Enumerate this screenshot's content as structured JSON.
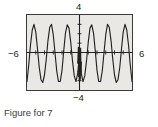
{
  "figure": {
    "caption": "Figure for 7",
    "axis_labels": {
      "y_max": "4",
      "y_min": "−4",
      "x_min": "−6",
      "x_max": "6"
    },
    "colors": {
      "plot_background": "#e9e8e5",
      "plot_border": "#3a3a38",
      "curve": "#231f20",
      "axis": "#231f20",
      "page_background": "#ffffff",
      "caption_text": "#3b3b3b"
    }
  },
  "chart_data": {
    "type": "line",
    "title": "",
    "subtitle": "",
    "xlabel": "",
    "ylabel": "",
    "xlim": [
      -6,
      6
    ],
    "ylim": [
      -4,
      4
    ],
    "xticks": [
      -6,
      -5,
      -4,
      -3,
      -2,
      -1,
      0,
      1,
      2,
      3,
      4,
      5,
      6
    ],
    "yticks": [
      -4,
      -3,
      -2,
      -1,
      0,
      1,
      2,
      3,
      4
    ],
    "grid": false,
    "tick_marks": true,
    "legend": null,
    "legend_position": "none",
    "annotations": [
      {
        "text": "4",
        "position": "top-center",
        "x": 0,
        "y": 4
      },
      {
        "text": "−4",
        "position": "bottom-center",
        "x": 0,
        "y": -4
      },
      {
        "text": "−6",
        "position": "left-middle",
        "x": -6,
        "y": 0
      },
      {
        "text": "6",
        "position": "right-middle",
        "x": 6,
        "y": 0
      }
    ],
    "series": [
      {
        "name": "curve",
        "description": "Oscillating wave, ~6 full cycles across [-6, 6], narrow cusp-like peaks reaching about y = 3 and broader troughs reaching about y = -3.2, with a compressed high-frequency spike near x = 0.",
        "color": "#231f20",
        "x": [
          -6.0,
          -5.8,
          -5.6,
          -5.4,
          -5.2,
          -5.0,
          -4.8,
          -4.6,
          -4.4,
          -4.2,
          -4.0,
          -3.8,
          -3.6,
          -3.4,
          -3.2,
          -3.0,
          -2.8,
          -2.6,
          -2.4,
          -2.2,
          -2.0,
          -1.8,
          -1.6,
          -1.4,
          -1.2,
          -1.0,
          -0.8,
          -0.6,
          -0.4,
          -0.2,
          -0.1,
          0.0,
          0.1,
          0.2,
          0.4,
          0.6,
          0.8,
          1.0,
          1.2,
          1.4,
          1.6,
          1.8,
          2.0,
          2.2,
          2.4,
          2.6,
          2.8,
          3.0,
          3.2,
          3.4,
          3.6,
          3.8,
          4.0,
          4.2,
          4.4,
          4.6,
          4.8,
          5.0,
          5.2,
          5.4,
          5.6,
          5.8,
          6.0
        ],
        "y": [
          -3.1,
          -1.3,
          0.8,
          2.4,
          3.0,
          2.2,
          0.4,
          -1.6,
          -2.9,
          -3.2,
          -2.4,
          -0.7,
          1.3,
          2.7,
          3.0,
          1.9,
          0.0,
          -2.0,
          -3.1,
          -3.1,
          -1.9,
          0.2,
          2.1,
          2.95,
          2.6,
          1.1,
          -0.9,
          -2.5,
          -3.1,
          -2.2,
          -1.2,
          0.3,
          -1.2,
          -2.2,
          -3.1,
          -2.5,
          -0.9,
          1.1,
          2.6,
          2.95,
          2.1,
          0.2,
          -1.9,
          -3.1,
          -3.1,
          -2.0,
          0.0,
          1.9,
          3.0,
          2.7,
          1.3,
          -0.7,
          -2.4,
          -3.2,
          -2.9,
          -1.6,
          0.4,
          2.2,
          3.0,
          2.4,
          0.8,
          -1.3,
          -3.1
        ]
      }
    ]
  }
}
